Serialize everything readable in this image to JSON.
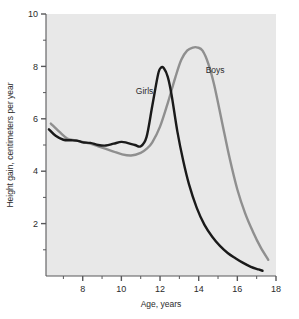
{
  "chart_data": {
    "type": "line",
    "title": "",
    "xlabel": "Age, years",
    "ylabel": "Height gain, centimeters per year",
    "xlim": [
      6.1,
      18
    ],
    "ylim": [
      0,
      10
    ],
    "xticks": [
      8,
      10,
      12,
      14,
      16,
      18
    ],
    "xtick_labels": [
      "8",
      "10",
      "12",
      "14",
      "16",
      "18"
    ],
    "xminor_ticks": [
      7,
      9,
      11,
      13,
      15,
      17
    ],
    "yticks": [
      2,
      4,
      6,
      8,
      10
    ],
    "ytick_labels": [
      "2",
      "4",
      "6",
      "8",
      "10"
    ],
    "yminor_ticks": [
      1,
      3,
      5,
      7,
      9
    ],
    "grid": false,
    "legend_position": "inline-annotations",
    "plot_background": "#e8e8e8",
    "series": [
      {
        "name": "Girls",
        "color": "#1a1a1a",
        "label_x": 11.2,
        "label_y": 6.95,
        "x": [
          6.25,
          6.6,
          7.0,
          7.4,
          7.8,
          8.0,
          8.4,
          8.8,
          9.2,
          9.6,
          10.0,
          10.3,
          10.7,
          11.0,
          11.3,
          11.6,
          11.9,
          12.05,
          12.2,
          12.4,
          12.6,
          12.9,
          13.2,
          13.5,
          13.9,
          14.3,
          14.7,
          15.1,
          15.5,
          15.9,
          16.3,
          16.7,
          17.1,
          17.3
        ],
        "y": [
          5.6,
          5.35,
          5.2,
          5.18,
          5.15,
          5.1,
          5.08,
          5.0,
          4.98,
          5.05,
          5.12,
          5.08,
          5.0,
          4.95,
          5.3,
          6.5,
          7.7,
          7.95,
          7.93,
          7.6,
          6.9,
          5.5,
          4.4,
          3.5,
          2.6,
          1.95,
          1.5,
          1.15,
          0.88,
          0.68,
          0.5,
          0.35,
          0.25,
          0.2
        ]
      },
      {
        "name": "Boys",
        "color": "#8f8f8f",
        "label_x": 14.85,
        "label_y": 7.75,
        "x": [
          6.35,
          6.8,
          7.2,
          7.6,
          8.0,
          8.4,
          8.8,
          9.2,
          9.6,
          10.0,
          10.5,
          11.0,
          11.3,
          11.6,
          12.0,
          12.4,
          12.8,
          13.1,
          13.4,
          13.7,
          13.95,
          14.2,
          14.5,
          14.8,
          15.2,
          15.6,
          16.0,
          16.4,
          16.8,
          17.2,
          17.6
        ],
        "y": [
          5.82,
          5.5,
          5.25,
          5.18,
          5.12,
          5.05,
          4.95,
          4.85,
          4.75,
          4.65,
          4.6,
          4.7,
          4.85,
          5.1,
          5.7,
          6.6,
          7.6,
          8.25,
          8.6,
          8.72,
          8.72,
          8.6,
          8.1,
          7.3,
          5.9,
          4.5,
          3.3,
          2.4,
          1.7,
          1.1,
          0.62
        ]
      }
    ]
  }
}
